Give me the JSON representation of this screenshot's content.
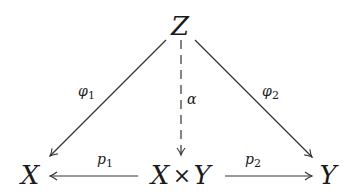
{
  "diagram": {
    "type": "commutative-diagram",
    "nodes": {
      "top": "Z",
      "left": "X",
      "center_left": "X",
      "center_op": "×",
      "center_right": "Y",
      "right": "Y"
    },
    "edges": [
      {
        "from": "Z",
        "to": "X",
        "label": "φ",
        "subscript": "1",
        "style": "solid"
      },
      {
        "from": "Z",
        "to": "Y",
        "label": "φ",
        "subscript": "2",
        "style": "solid"
      },
      {
        "from": "Z",
        "to": "X × Y",
        "label": "α",
        "subscript": "",
        "style": "dashed"
      },
      {
        "from": "X × Y",
        "to": "X",
        "label": "p",
        "subscript": "1",
        "style": "solid"
      },
      {
        "from": "X × Y",
        "to": "Y",
        "label": "p",
        "subscript": "2",
        "style": "solid"
      }
    ]
  }
}
